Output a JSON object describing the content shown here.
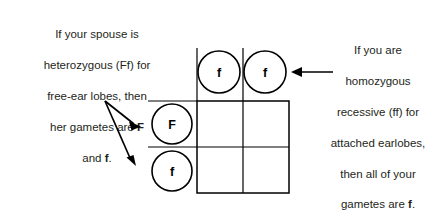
{
  "diagram": {
    "background_color": "#ffffff",
    "line_color": "#000000",
    "text_color": "#231f20"
  },
  "captions": {
    "left": {
      "name": "spouse-gametes-caption",
      "lines": [
        "If your spouse is",
        "heterozygous (Ff) for",
        "free-ear lobes, then",
        "her gametes are F",
        "and f."
      ],
      "text": "If your spouse is\nheterozygous (Ff) for\nfree-ear lobes, then\nher gametes are F\nand f.",
      "bold_terms": [
        "F",
        "f"
      ]
    },
    "right": {
      "name": "self-gametes-caption",
      "lines": [
        "If you are",
        "homozygous",
        "recessive (ff) for",
        "attached earlobes,",
        "then all of your",
        "gametes are f."
      ],
      "text": "If you are\nhomozygous\nrecessive (ff) for\nattached earlobes,\nthen all of your\ngametes are f.",
      "bold_terms": [
        "f"
      ]
    }
  },
  "punnett": {
    "box": {
      "x": 197,
      "y": 101,
      "width": 92,
      "height": 92
    },
    "columns": 2,
    "rows": 2,
    "column_gametes": [
      {
        "label": "f",
        "cx": 219,
        "cy": 72,
        "r": 21
      },
      {
        "label": "f",
        "cx": 265,
        "cy": 72,
        "r": 21
      }
    ],
    "row_gametes": [
      {
        "label": "F",
        "cx": 172,
        "cy": 124,
        "r": 20
      },
      {
        "label": "f",
        "cx": 172,
        "cy": 171,
        "r": 20
      }
    ],
    "cells": [
      {
        "row": 0,
        "col": 0,
        "value": ""
      },
      {
        "row": 0,
        "col": 1,
        "value": ""
      },
      {
        "row": 1,
        "col": 0,
        "value": ""
      },
      {
        "row": 1,
        "col": 1,
        "value": ""
      }
    ]
  },
  "arrows": [
    {
      "name": "arrow-to-row-F",
      "direction": "right",
      "from": [
        105,
        100
      ],
      "to": [
        141,
        125
      ]
    },
    {
      "name": "arrow-to-row-f",
      "direction": "down-right",
      "from": [
        105,
        100
      ],
      "to": [
        136,
        164
      ]
    },
    {
      "name": "arrow-to-column-gametes",
      "direction": "left",
      "from": [
        333,
        72
      ],
      "to": [
        291,
        72
      ]
    }
  ]
}
